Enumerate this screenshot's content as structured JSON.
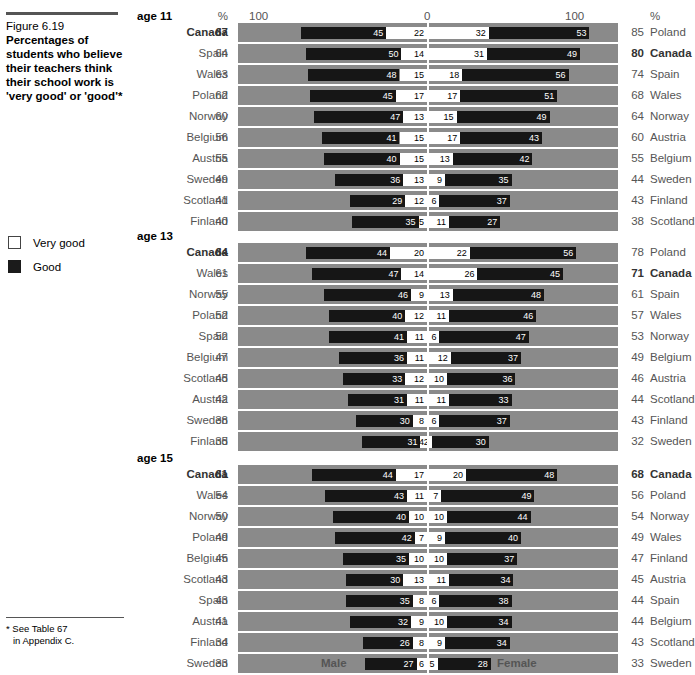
{
  "figure": {
    "number": "Figure 6.19",
    "title": "Percentages of students who believe their teachers think their school work is 'very good' or 'good'*",
    "footnote_line1": "* See Table 67",
    "footnote_line2": "in Appendix C."
  },
  "legend": {
    "items": [
      {
        "label": "Very good",
        "swatch": "white-square-icon",
        "color": "#ffffff"
      },
      {
        "label": "Good",
        "swatch": "black-square-icon",
        "color": "#161616"
      }
    ]
  },
  "axis": {
    "left_100": "100",
    "zero": "0",
    "right_100": "100",
    "pct_left": "%",
    "pct_right": "%",
    "male_label": "Male",
    "female_label": "Female",
    "max": 100,
    "half_width_px": 190
  },
  "colors": {
    "band": "#8a8a8a",
    "good": "#161616",
    "very_good": "#ffffff",
    "text": "#555555",
    "highlight_text": "#333333"
  },
  "chart_data": {
    "type": "bar",
    "orientation": "horizontal-diverging-stacked",
    "title": "Percentages of students who believe their teachers think their school work is 'very good' or 'good'",
    "xlabel": "",
    "ylabel": "",
    "xlim": [
      -100,
      100
    ],
    "grid": false,
    "legend_position": "left",
    "series_names": [
      "Very good",
      "Good"
    ],
    "left_side": "Male",
    "right_side": "Female",
    "groups": [
      {
        "age": "age 11",
        "rows": [
          {
            "left_country": "Canada",
            "left_total": 67,
            "male_good": 45,
            "male_very_good": 22,
            "female_very_good": 32,
            "female_good": 53,
            "right_total": 85,
            "right_country": "Poland",
            "left_bold": true,
            "right_bold": false
          },
          {
            "left_country": "Spain",
            "left_total": 64,
            "male_good": 50,
            "male_very_good": 14,
            "female_very_good": 31,
            "female_good": 49,
            "right_total": 80,
            "right_country": "Canada",
            "left_bold": false,
            "right_bold": true
          },
          {
            "left_country": "Wales",
            "left_total": 63,
            "male_good": 48,
            "male_very_good": 15,
            "female_very_good": 18,
            "female_good": 56,
            "right_total": 74,
            "right_country": "Spain",
            "left_bold": false,
            "right_bold": false
          },
          {
            "left_country": "Poland",
            "left_total": 62,
            "male_good": 45,
            "male_very_good": 17,
            "female_very_good": 17,
            "female_good": 51,
            "right_total": 68,
            "right_country": "Wales",
            "left_bold": false,
            "right_bold": false
          },
          {
            "left_country": "Norway",
            "left_total": 60,
            "male_good": 47,
            "male_very_good": 13,
            "female_very_good": 15,
            "female_good": 49,
            "right_total": 64,
            "right_country": "Norway",
            "left_bold": false,
            "right_bold": false
          },
          {
            "left_country": "Belgium",
            "left_total": 56,
            "male_good": 41,
            "male_very_good": 15,
            "female_very_good": 17,
            "female_good": 43,
            "right_total": 60,
            "right_country": "Austria",
            "left_bold": false,
            "right_bold": false
          },
          {
            "left_country": "Austria",
            "left_total": 55,
            "male_good": 40,
            "male_very_good": 15,
            "female_very_good": 13,
            "female_good": 42,
            "right_total": 55,
            "right_country": "Belgium",
            "left_bold": false,
            "right_bold": false
          },
          {
            "left_country": "Sweden",
            "left_total": 49,
            "male_good": 36,
            "male_very_good": 13,
            "female_very_good": 9,
            "female_good": 35,
            "right_total": 44,
            "right_country": "Sweden",
            "left_bold": false,
            "right_bold": false
          },
          {
            "left_country": "Scotland",
            "left_total": 41,
            "male_good": 29,
            "male_very_good": 12,
            "female_very_good": 6,
            "female_good": 37,
            "right_total": 43,
            "right_country": "Finland",
            "left_bold": false,
            "right_bold": false
          },
          {
            "left_country": "Finland",
            "left_total": 40,
            "male_good": 35,
            "male_very_good": 5,
            "female_very_good": 11,
            "female_good": 27,
            "right_total": 38,
            "right_country": "Scotland",
            "left_bold": false,
            "right_bold": false
          }
        ]
      },
      {
        "age": "age 13",
        "rows": [
          {
            "left_country": "Canada",
            "left_total": 64,
            "male_good": 44,
            "male_very_good": 20,
            "female_very_good": 22,
            "female_good": 56,
            "right_total": 78,
            "right_country": "Poland",
            "left_bold": true,
            "right_bold": false
          },
          {
            "left_country": "Wales",
            "left_total": 61,
            "male_good": 47,
            "male_very_good": 14,
            "female_very_good": 26,
            "female_good": 45,
            "right_total": 71,
            "right_country": "Canada",
            "left_bold": false,
            "right_bold": true
          },
          {
            "left_country": "Norway",
            "left_total": 55,
            "male_good": 46,
            "male_very_good": 9,
            "female_very_good": 13,
            "female_good": 48,
            "right_total": 61,
            "right_country": "Spain",
            "left_bold": false,
            "right_bold": false
          },
          {
            "left_country": "Poland",
            "left_total": 52,
            "male_good": 40,
            "male_very_good": 12,
            "female_very_good": 11,
            "female_good": 46,
            "right_total": 57,
            "right_country": "Wales",
            "left_bold": false,
            "right_bold": false
          },
          {
            "left_country": "Spain",
            "left_total": 52,
            "male_good": 41,
            "male_very_good": 11,
            "female_very_good": 6,
            "female_good": 47,
            "right_total": 53,
            "right_country": "Norway",
            "left_bold": false,
            "right_bold": false
          },
          {
            "left_country": "Belgium",
            "left_total": 47,
            "male_good": 36,
            "male_very_good": 11,
            "female_very_good": 12,
            "female_good": 37,
            "right_total": 49,
            "right_country": "Belgium",
            "left_bold": false,
            "right_bold": false
          },
          {
            "left_country": "Scotland",
            "left_total": 45,
            "male_good": 33,
            "male_very_good": 12,
            "female_very_good": 10,
            "female_good": 36,
            "right_total": 46,
            "right_country": "Austria",
            "left_bold": false,
            "right_bold": false
          },
          {
            "left_country": "Austria",
            "left_total": 42,
            "male_good": 31,
            "male_very_good": 11,
            "female_very_good": 11,
            "female_good": 33,
            "right_total": 44,
            "right_country": "Scotland",
            "left_bold": false,
            "right_bold": false
          },
          {
            "left_country": "Sweden",
            "left_total": 38,
            "male_good": 30,
            "male_very_good": 8,
            "female_very_good": 6,
            "female_good": 37,
            "right_total": 43,
            "right_country": "Finland",
            "left_bold": false,
            "right_bold": false
          },
          {
            "left_country": "Finland",
            "left_total": 35,
            "male_good": 31,
            "male_very_good": 4,
            "female_very_good": 2,
            "female_good": 30,
            "right_total": 32,
            "right_country": "Sweden",
            "left_bold": false,
            "right_bold": false
          }
        ]
      },
      {
        "age": "age 15",
        "rows": [
          {
            "left_country": "Canada",
            "left_total": 61,
            "male_good": 44,
            "male_very_good": 17,
            "female_very_good": 20,
            "female_good": 48,
            "right_total": 68,
            "right_country": "Canada",
            "left_bold": true,
            "right_bold": true
          },
          {
            "left_country": "Wales",
            "left_total": 54,
            "male_good": 43,
            "male_very_good": 11,
            "female_very_good": 7,
            "female_good": 49,
            "right_total": 56,
            "right_country": "Poland",
            "left_bold": false,
            "right_bold": false
          },
          {
            "left_country": "Norway",
            "left_total": 50,
            "male_good": 40,
            "male_very_good": 10,
            "female_very_good": 10,
            "female_good": 44,
            "right_total": 54,
            "right_country": "Norway",
            "left_bold": false,
            "right_bold": false
          },
          {
            "left_country": "Poland",
            "left_total": 49,
            "male_good": 42,
            "male_very_good": 7,
            "female_very_good": 9,
            "female_good": 40,
            "right_total": 49,
            "right_country": "Wales",
            "left_bold": false,
            "right_bold": false
          },
          {
            "left_country": "Belgium",
            "left_total": 45,
            "male_good": 35,
            "male_very_good": 10,
            "female_very_good": 10,
            "female_good": 37,
            "right_total": 47,
            "right_country": "Finland",
            "left_bold": false,
            "right_bold": false
          },
          {
            "left_country": "Scotland",
            "left_total": 43,
            "male_good": 30,
            "male_very_good": 13,
            "female_very_good": 11,
            "female_good": 34,
            "right_total": 45,
            "right_country": "Austria",
            "left_bold": false,
            "right_bold": false
          },
          {
            "left_country": "Spain",
            "left_total": 43,
            "male_good": 35,
            "male_very_good": 8,
            "female_very_good": 6,
            "female_good": 38,
            "right_total": 44,
            "right_country": "Spain",
            "left_bold": false,
            "right_bold": false
          },
          {
            "left_country": "Austria",
            "left_total": 41,
            "male_good": 32,
            "male_very_good": 9,
            "female_very_good": 10,
            "female_good": 34,
            "right_total": 44,
            "right_country": "Belgium",
            "left_bold": false,
            "right_bold": false
          },
          {
            "left_country": "Finland",
            "left_total": 34,
            "male_good": 26,
            "male_very_good": 8,
            "female_very_good": 9,
            "female_good": 34,
            "right_total": 43,
            "right_country": "Scotland",
            "left_bold": false,
            "right_bold": false
          },
          {
            "left_country": "Sweden",
            "left_total": 33,
            "male_good": 27,
            "male_very_good": 6,
            "female_very_good": 5,
            "female_good": 28,
            "right_total": 33,
            "right_country": "Sweden",
            "left_bold": false,
            "right_bold": false
          }
        ]
      }
    ]
  }
}
